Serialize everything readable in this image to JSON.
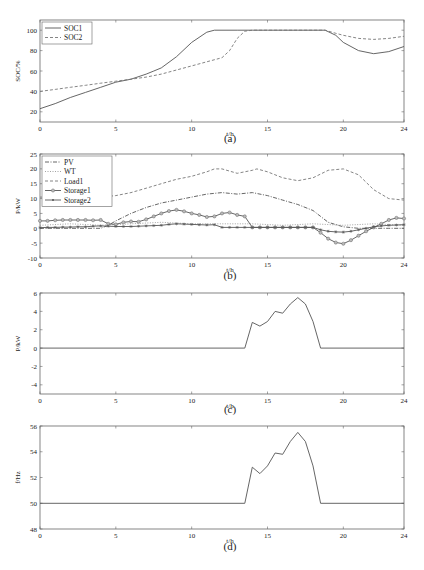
{
  "chart_data": [
    {
      "id": "a",
      "type": "line",
      "caption": "(a)",
      "xlabel": "t/h",
      "ylabel": "SOC/%",
      "xlim": [
        0,
        24
      ],
      "ylim": [
        10,
        110
      ],
      "xticks": [
        0,
        5,
        10,
        15,
        20,
        24
      ],
      "yticks": [
        20,
        40,
        60,
        80,
        100
      ],
      "legend": "top-left",
      "series": [
        {
          "name": "SOC1",
          "style": "solid",
          "marker": "none",
          "x": [
            0,
            1,
            2,
            3,
            4,
            5,
            6,
            7,
            7.5,
            8,
            9,
            10,
            11,
            11.5,
            12,
            13,
            14,
            15,
            16,
            17,
            18,
            18.8,
            19.5,
            20,
            21,
            22,
            23,
            24
          ],
          "y": [
            23,
            28,
            34,
            39,
            44,
            49,
            52,
            57,
            60,
            63,
            74,
            88,
            98,
            100,
            100,
            100,
            100,
            100,
            100,
            100,
            100,
            100,
            95,
            88,
            80,
            77,
            79,
            84
          ]
        },
        {
          "name": "SOC2",
          "style": "dashed",
          "marker": "none",
          "x": [
            0,
            1,
            2,
            3,
            4,
            5,
            6,
            7,
            8,
            9,
            10,
            11,
            12,
            12.5,
            13,
            13.5,
            14,
            15,
            16,
            17,
            18,
            18.8,
            19.5,
            20,
            21,
            22,
            23,
            24
          ],
          "y": [
            40,
            42,
            44,
            46,
            48,
            50,
            52,
            54,
            57,
            61,
            65,
            69,
            73,
            80,
            92,
            99,
            100,
            100,
            100,
            100,
            100,
            100,
            97,
            95,
            92,
            91,
            92,
            94
          ]
        }
      ]
    },
    {
      "id": "b",
      "type": "line",
      "caption": "(b)",
      "xlabel": "t/h",
      "ylabel": "P/kW",
      "xlim": [
        0,
        24
      ],
      "ylim": [
        -10,
        25
      ],
      "xticks": [
        0,
        5,
        10,
        15,
        20,
        24
      ],
      "yticks": [
        -10,
        -5,
        0,
        5,
        10,
        15,
        20,
        25
      ],
      "legend": "top-left",
      "series": [
        {
          "name": "PV",
          "style": "dashdot",
          "marker": "none",
          "x": [
            0,
            4,
            4.5,
            5,
            6,
            7,
            8,
            9,
            10,
            11,
            12,
            13,
            14,
            15,
            16,
            17,
            18,
            19,
            20,
            21,
            22,
            23,
            24
          ],
          "y": [
            0,
            0,
            1,
            2.5,
            5,
            7,
            8.5,
            9.5,
            10.5,
            11.5,
            12,
            11.5,
            12,
            11,
            9.5,
            8,
            6,
            2,
            0.5,
            0,
            0,
            0,
            0
          ]
        },
        {
          "name": "WT",
          "style": "dotted",
          "marker": "none",
          "x": [
            0,
            2,
            4,
            6,
            8,
            10,
            12,
            14,
            16,
            18,
            20,
            22,
            24
          ],
          "y": [
            1,
            1.5,
            1,
            1.5,
            2,
            1.5,
            1.5,
            1.5,
            1,
            1.5,
            1,
            1.5,
            1
          ]
        },
        {
          "name": "Load1",
          "style": "dashed",
          "marker": "none",
          "x": [
            0,
            4,
            5,
            6,
            7,
            8,
            9,
            10,
            11,
            11.5,
            12,
            13,
            14,
            14.3,
            15,
            16,
            17,
            18,
            19,
            20,
            21,
            22,
            23,
            24
          ],
          "y": [
            10.5,
            10.5,
            11,
            12,
            13.5,
            15,
            16.5,
            17.5,
            19,
            20,
            20,
            18.5,
            19.5,
            20,
            19,
            17,
            16,
            17,
            19.5,
            20,
            18,
            13,
            10,
            9.5
          ]
        },
        {
          "name": "Storage1",
          "style": "solid",
          "marker": "circle",
          "x": [
            0,
            0.5,
            1,
            1.5,
            2,
            2.5,
            3,
            3.5,
            4,
            4.5,
            5,
            5.5,
            6,
            6.5,
            7,
            7.5,
            8,
            8.5,
            9,
            9.5,
            10,
            10.5,
            11,
            11.5,
            12,
            12.5,
            13,
            13.5,
            14,
            14.5,
            15,
            15.5,
            16,
            16.5,
            17,
            17.5,
            18,
            18.5,
            19,
            19.5,
            20,
            20.5,
            21,
            21.5,
            22,
            22.5,
            23,
            23.5,
            24
          ],
          "y": [
            2.5,
            2.5,
            2.7,
            2.8,
            2.8,
            2.8,
            2.8,
            2.7,
            2.8,
            1.5,
            1.3,
            2,
            2.3,
            2.2,
            3,
            4,
            5,
            5.8,
            6.2,
            5.7,
            5,
            4.5,
            3.8,
            4,
            5,
            5.3,
            4.5,
            4,
            0.3,
            0.3,
            0.3,
            0.3,
            0.3,
            0.3,
            0.3,
            0.3,
            0.3,
            -1.5,
            -3.5,
            -4.8,
            -5.2,
            -4,
            -2.5,
            -1,
            0.3,
            1.5,
            2.8,
            3.5,
            3.3
          ]
        },
        {
          "name": "Storage2",
          "style": "solid",
          "marker": "star",
          "x": [
            0,
            0.5,
            1,
            1.5,
            2,
            2.5,
            3,
            3.5,
            4,
            4.5,
            5,
            5.5,
            6,
            6.5,
            7,
            7.5,
            8,
            8.5,
            9,
            9.5,
            10,
            10.5,
            11,
            11.5,
            12,
            12.5,
            13,
            13.5,
            14,
            14.5,
            15,
            15.5,
            16,
            16.5,
            17,
            17.5,
            18,
            18.5,
            19,
            19.5,
            20,
            20.5,
            21,
            21.5,
            22,
            22.5,
            23,
            23.5,
            24
          ],
          "y": [
            0.2,
            0.3,
            0.3,
            0.4,
            0.4,
            0.5,
            0.5,
            0.7,
            0.8,
            0.7,
            0.6,
            0.6,
            0.6,
            0.7,
            0.8,
            0.9,
            1,
            1.3,
            1.5,
            1.4,
            1.3,
            1.2,
            1.1,
            1.2,
            0.3,
            0.3,
            0.3,
            0.3,
            0.3,
            0.3,
            0.3,
            0.3,
            0.3,
            0.3,
            0.3,
            0.3,
            0.3,
            -0.5,
            -1,
            -1.2,
            -1.3,
            -1,
            -0.5,
            0,
            0.5,
            0.8,
            1,
            1.1,
            1.2
          ]
        }
      ]
    },
    {
      "id": "c",
      "type": "line",
      "caption": "(c)",
      "xlabel": "t/h",
      "ylabel": "P/kW",
      "xlim": [
        0,
        24
      ],
      "ylim": [
        -5,
        6
      ],
      "xticks": [
        0,
        5,
        10,
        15,
        20,
        24
      ],
      "yticks": [
        -4,
        -2,
        0,
        2,
        4,
        6
      ],
      "legend": "none",
      "series": [
        {
          "name": "P",
          "style": "solid",
          "marker": "none",
          "x": [
            0,
            13.5,
            14,
            14.5,
            15,
            15.5,
            16,
            16.5,
            17,
            17.5,
            18,
            18.5,
            24
          ],
          "y": [
            0,
            0,
            2.8,
            2.4,
            2.9,
            4,
            3.8,
            4.8,
            5.5,
            4.8,
            2.9,
            0,
            0
          ]
        }
      ]
    },
    {
      "id": "d",
      "type": "line",
      "caption": "(d)",
      "xlabel": "t/h",
      "ylabel": "f/Hz",
      "xlim": [
        0,
        24
      ],
      "ylim": [
        48,
        56
      ],
      "xticks": [
        0,
        5,
        10,
        15,
        20,
        24
      ],
      "yticks": [
        48,
        50,
        52,
        54,
        56
      ],
      "legend": "none",
      "series": [
        {
          "name": "f",
          "style": "solid",
          "marker": "none",
          "x": [
            0,
            13.5,
            14,
            14.5,
            15,
            15.5,
            16,
            16.5,
            17,
            17.5,
            18,
            18.5,
            24
          ],
          "y": [
            50,
            50,
            52.8,
            52.3,
            52.9,
            53.9,
            53.8,
            54.8,
            55.5,
            54.8,
            52.9,
            50,
            50
          ]
        }
      ]
    }
  ]
}
